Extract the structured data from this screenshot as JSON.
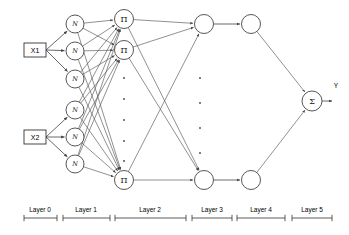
{
  "diagram": {
    "canvas": {
      "width": 349,
      "height": 235
    },
    "colors": {
      "edge": "#555555",
      "node_stroke": "#444444",
      "node_fill": "#ffffff",
      "text": "#000000",
      "background": "#ffffff"
    },
    "inputs": [
      {
        "id": "x1",
        "label": "X1",
        "x": 35,
        "y": 50
      },
      {
        "id": "x2",
        "label": "X2",
        "x": 35,
        "y": 137
      }
    ],
    "output": {
      "id": "y",
      "label": "Y",
      "x": 336,
      "y": 85
    },
    "layers": [
      {
        "index": 0,
        "label": "Layer 0",
        "tick_start": 24,
        "tick_end": 57,
        "label_x": 40
      },
      {
        "index": 1,
        "label": "Layer 1",
        "tick_start": 63,
        "tick_end": 110,
        "label_x": 86
      },
      {
        "index": 2,
        "label": "Layer 2",
        "tick_start": 115,
        "tick_end": 186,
        "label_x": 150
      },
      {
        "index": 3,
        "label": "Layer 3",
        "tick_start": 192,
        "tick_end": 232,
        "label_x": 212
      },
      {
        "index": 4,
        "label": "Layer 4",
        "tick_start": 237,
        "tick_end": 285,
        "label_x": 261
      },
      {
        "index": 5,
        "label": "Layer 5",
        "tick_start": 292,
        "tick_end": 332,
        "label_x": 312
      }
    ],
    "layer_axis_y": 218,
    "nodes": {
      "layer1": {
        "symbol": "N",
        "symbol_name": "gaussian-membership-function",
        "radius": 9,
        "x": 75,
        "positions_y": [
          24,
          51,
          79,
          110,
          137,
          164
        ]
      },
      "layer2": {
        "symbol": "Π",
        "symbol_name": "product-node",
        "radius": 9.5,
        "x": 124,
        "positions_y": [
          19,
          50,
          180
        ]
      },
      "layer3": {
        "symbol": "",
        "symbol_name": "normalization-node",
        "radius": 9.5,
        "x": 204,
        "positions_y": [
          24,
          180
        ]
      },
      "layer4": {
        "symbol": "",
        "symbol_name": "consequent-node",
        "radius": 9.5,
        "x": 251,
        "positions_y": [
          24,
          180
        ]
      },
      "layer5": {
        "symbol": "Σ",
        "symbol_name": "summation-node",
        "radius": 10,
        "x": 312,
        "positions_y": [
          101
        ]
      }
    },
    "ellipses": [
      {
        "id": "layer2-vertical-dots",
        "x": 124,
        "ys": [
          78,
          99,
          120,
          141,
          161
        ]
      },
      {
        "id": "layer3-vertical-dots",
        "x": 200,
        "ys": [
          78,
          103,
          128,
          153
        ]
      }
    ]
  }
}
